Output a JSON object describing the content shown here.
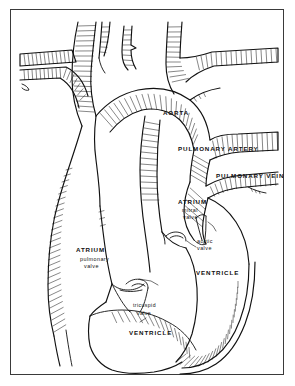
{
  "figure": {
    "style": "pen-and-ink hatched line art",
    "background_color": "#ffffff",
    "ink_color": "#111111",
    "frame_color": "#3a3a3a",
    "width": 295,
    "height": 386
  },
  "labels": {
    "aorta": "AORTA",
    "pulmonary_artery": "PULMONARY ARTERY",
    "pulmonary_vein": "PULMONARY VEIN",
    "left_atrium": "ATRIUM",
    "mitral_valve_line1": "mitral",
    "mitral_valve_line2": "valve",
    "aortic_valve_line1": "aortic",
    "aortic_valve_line2": "valve",
    "right_atrium": "ATRIUM",
    "pulmonary_valve_line1": "pulmonary",
    "pulmonary_valve_line2": "valve",
    "tricuspid_valve_line1": "tricuspid",
    "tricuspid_valve_line2": "valve",
    "left_ventricle": "VENTRICLE",
    "right_ventricle": "VENTRICLE"
  }
}
